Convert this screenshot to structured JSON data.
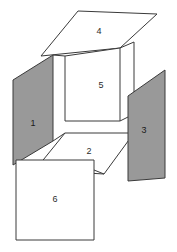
{
  "figure": {
    "background_color": "#ffffff",
    "line_color": "#3a3a3a",
    "shaded_fill": "#999999",
    "white_fill": "#ffffff",
    "faces": [
      {
        "id": "face-1",
        "label": "1",
        "fill": "shaded",
        "position": "left",
        "label_x": 33,
        "label_y": 124
      },
      {
        "id": "face-2",
        "label": "2",
        "fill": "white",
        "position": "bottom",
        "label_x": 89,
        "label_y": 152
      },
      {
        "id": "face-3",
        "label": "3",
        "fill": "shaded",
        "position": "right",
        "label_x": 144,
        "label_y": 131
      },
      {
        "id": "face-4",
        "label": "4",
        "fill": "white",
        "position": "top",
        "label_x": 99,
        "label_y": 32
      },
      {
        "id": "face-5",
        "label": "5",
        "fill": "white",
        "position": "back",
        "label_x": 101,
        "label_y": 86
      },
      {
        "id": "face-6",
        "label": "6",
        "fill": "white",
        "position": "front",
        "label_x": 55,
        "label_y": 200
      }
    ]
  }
}
